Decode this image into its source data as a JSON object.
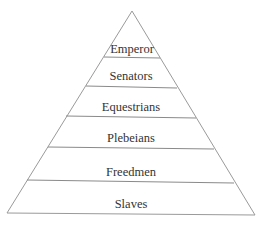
{
  "diagram": {
    "type": "pyramid",
    "line_color": "#9a9a9a",
    "text_color": "#333333",
    "levels": [
      {
        "label": "Emperor"
      },
      {
        "label": "Senators"
      },
      {
        "label": "Equestrians"
      },
      {
        "label": "Plebeians"
      },
      {
        "label": "Freedmen"
      },
      {
        "label": "Slaves"
      }
    ]
  }
}
